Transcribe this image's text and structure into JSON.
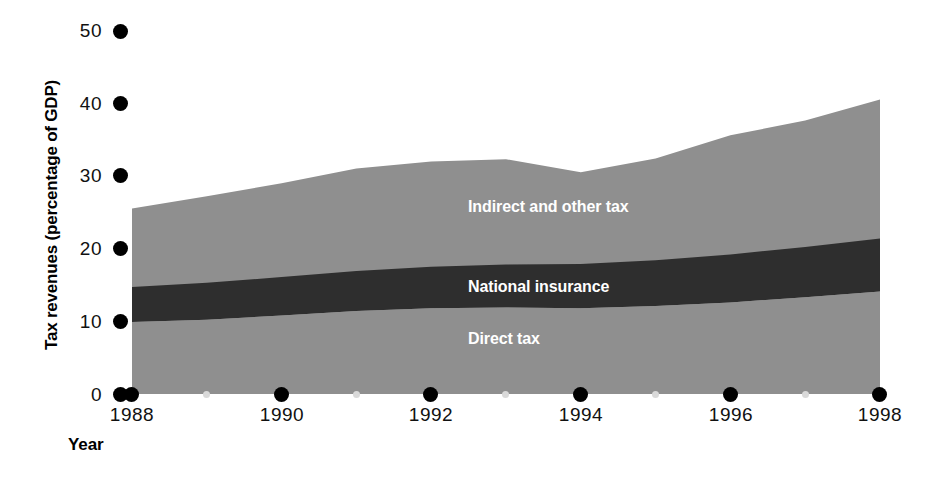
{
  "chart_data": {
    "type": "area",
    "title": "",
    "xlabel": "Year",
    "ylabel": "Tax revenues (percentage of GDP)",
    "xlim": [
      1988,
      1998
    ],
    "ylim": [
      0,
      50
    ],
    "yticks": [
      0,
      10,
      20,
      30,
      40,
      50
    ],
    "xticks": [
      1988,
      1990,
      1992,
      1994,
      1996,
      1998
    ],
    "x_minor_ticks": [
      1989,
      1991,
      1993,
      1995,
      1997
    ],
    "grid": false,
    "legend": "inline-labels",
    "stacked": true,
    "x": [
      1988,
      1989,
      1990,
      1991,
      1992,
      1993,
      1994,
      1995,
      1996,
      1997,
      1998
    ],
    "series": [
      {
        "name": "Direct tax",
        "color": "#8f8f8f",
        "values": [
          9.9,
          10.2,
          10.8,
          11.4,
          11.8,
          11.9,
          11.8,
          12.1,
          12.6,
          13.3,
          14.1
        ]
      },
      {
        "name": "National insurance",
        "color": "#2e2e2e",
        "values": [
          4.8,
          5.1,
          5.3,
          5.5,
          5.7,
          5.9,
          6.1,
          6.3,
          6.6,
          6.9,
          7.3
        ]
      },
      {
        "name": "Indirect and other tax",
        "color": "#8f8f8f",
        "values": [
          10.8,
          11.9,
          12.9,
          14.1,
          14.5,
          14.5,
          12.6,
          14.0,
          16.4,
          17.4,
          19.1
        ]
      }
    ],
    "stack_tops": {
      "direct_tax": [
        9.9,
        10.2,
        10.8,
        11.4,
        11.8,
        11.9,
        11.8,
        12.1,
        12.6,
        13.3,
        14.1
      ],
      "national_insurance": [
        14.7,
        15.3,
        16.1,
        16.9,
        17.5,
        17.8,
        17.9,
        18.4,
        19.2,
        20.2,
        21.4
      ],
      "total": [
        25.5,
        27.2,
        29.0,
        31.0,
        32.0,
        32.3,
        30.5,
        32.4,
        35.6,
        37.6,
        40.5
      ]
    }
  },
  "axis": {
    "y_title": "Tax revenues (percentage of GDP)",
    "x_title": "Year",
    "y_tick_labels": [
      "50",
      "40",
      "30",
      "20",
      "10",
      "0"
    ],
    "x_tick_labels": [
      "1988",
      "1990",
      "1992",
      "1994",
      "1996",
      "1998"
    ]
  },
  "series_labels": {
    "indirect": "Indirect and other tax",
    "national": "National insurance",
    "direct": "Direct tax"
  },
  "colors": {
    "light_gray": "#8f8f8f",
    "dark_gray": "#2e2e2e",
    "tick_major": "#000000",
    "tick_minor": "#d9d9d9",
    "label_text": "#ffffff",
    "background": "#ffffff"
  }
}
